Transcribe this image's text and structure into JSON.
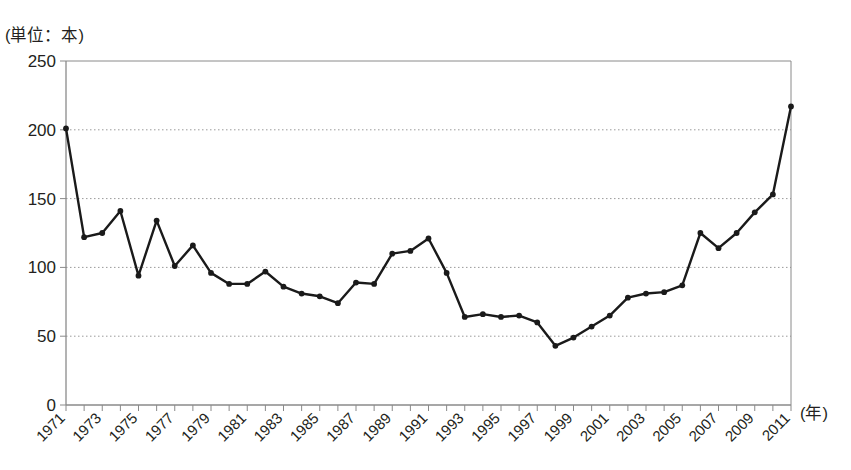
{
  "chart_data": {
    "type": "line",
    "title": "",
    "unit_label": "(単位：本)",
    "xlabel": "(年)",
    "ylabel": "",
    "ylim": [
      0,
      250
    ],
    "yticks": [
      0,
      50,
      100,
      150,
      200,
      250
    ],
    "ytick_labels": [
      "0",
      "50",
      "100",
      "150",
      "200",
      "250"
    ],
    "xlim": [
      1971,
      2011
    ],
    "xtick_labels": [
      "1971",
      "1973",
      "1975",
      "1977",
      "1979",
      "1981",
      "1983",
      "1985",
      "1987",
      "1989",
      "1991",
      "1993",
      "1995",
      "1997",
      "1999",
      "2001",
      "2003",
      "2005",
      "2007",
      "2009",
      "2011"
    ],
    "grid": "horizontal-dotted",
    "legend": "none",
    "marker": "filled-circle",
    "line_color": "#1a1a1a",
    "grid_color": "#9a9a9a",
    "axis_color": "#8a8a8a",
    "x": [
      1971,
      1972,
      1973,
      1974,
      1975,
      1976,
      1977,
      1978,
      1979,
      1980,
      1981,
      1982,
      1983,
      1984,
      1985,
      1986,
      1987,
      1988,
      1989,
      1990,
      1991,
      1992,
      1993,
      1994,
      1995,
      1996,
      1997,
      1998,
      1999,
      2000,
      2001,
      2002,
      2003,
      2004,
      2005,
      2006,
      2007,
      2008,
      2009,
      2010,
      2011
    ],
    "values": [
      201,
      122,
      125,
      141,
      94,
      134,
      101,
      116,
      96,
      88,
      88,
      97,
      86,
      81,
      79,
      74,
      89,
      88,
      110,
      112,
      121,
      96,
      64,
      66,
      64,
      65,
      60,
      43,
      49,
      57,
      65,
      78,
      81,
      82,
      87,
      125,
      114,
      125,
      140,
      153,
      217
    ]
  }
}
